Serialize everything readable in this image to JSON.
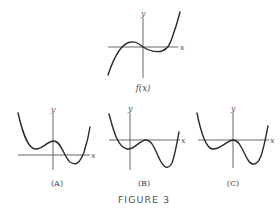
{
  "figure": {
    "title": "FIGURE 3",
    "axis_labels": {
      "x": "x",
      "y": "y"
    },
    "panels": [
      {
        "id": "f",
        "caption": "f(x)",
        "description": "cubic: rises from lower-left, local max left of origin, passes through origin, local min right of origin, rises to upper-right"
      },
      {
        "id": "A",
        "caption": "(A)",
        "description": "quartic-like: local min left of y-axis above x-axis, local max on y-axis above x-axis, local min right below x-axis"
      },
      {
        "id": "B",
        "caption": "(B)",
        "description": "quartic-like: local min at y-axis below x-axis, local max touching x-axis right of origin, deeper local min further right"
      },
      {
        "id": "C",
        "caption": "(C)",
        "description": "quartic-like: local min left below x-axis, local max at origin on x-axis, deeper local min right below x-axis"
      }
    ]
  },
  "colors": {
    "curve": "#2a2a2a",
    "axis": "#555555",
    "text": "#444444",
    "background": "#ffffff"
  }
}
